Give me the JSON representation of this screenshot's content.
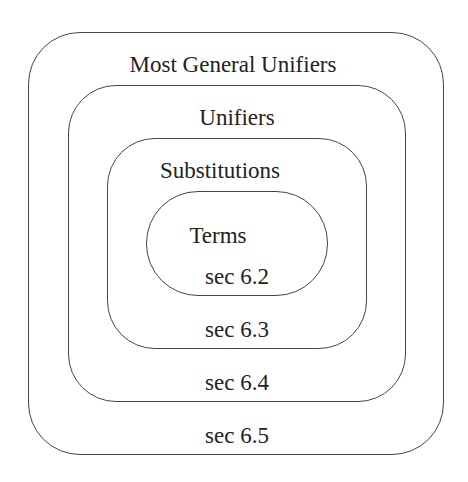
{
  "diagram": {
    "type": "nested-sets",
    "sets": [
      {
        "name": "Most General Unifiers",
        "section": "sec 6.5",
        "level": 1
      },
      {
        "name": "Unifiers",
        "section": "sec 6.4",
        "level": 2
      },
      {
        "name": "Substitutions",
        "section": "sec 6.3",
        "level": 3
      },
      {
        "name": "Terms",
        "section": "sec 6.2",
        "level": 4
      }
    ]
  }
}
